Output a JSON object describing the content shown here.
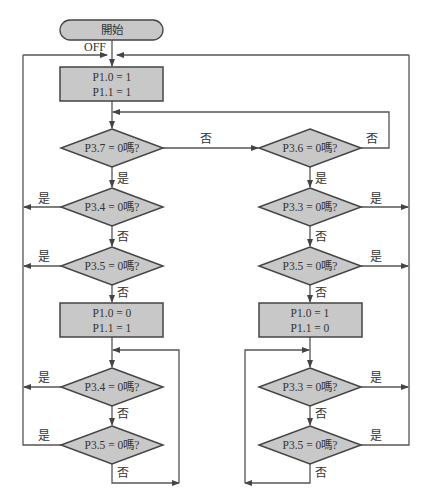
{
  "diagram": {
    "type": "flowchart",
    "colors": {
      "fill": "#c8c8c8",
      "stroke": "#444444",
      "line": "#555555",
      "text": "#333333"
    },
    "start": {
      "label": "開始"
    },
    "off_label": "OFF",
    "boxes": [
      {
        "id": "box1",
        "line1": "P1.0 = 1",
        "line2": "P1.1 = 1"
      },
      {
        "id": "box2",
        "line1": "P1.0 = 0",
        "line2": "P1.1 = 1"
      },
      {
        "id": "box3",
        "line1": "P1.0 = 1",
        "line2": "P1.1 = 0"
      }
    ],
    "decisions": [
      {
        "id": "d1",
        "label": "P3.7 = 0嗎?"
      },
      {
        "id": "d2",
        "label": "P3.6 = 0嗎?"
      },
      {
        "id": "d3",
        "label": "P3.4 = 0嗎?"
      },
      {
        "id": "d4",
        "label": "P3.5 = 0嗎?"
      },
      {
        "id": "d5",
        "label": "P3.3 = 0嗎?"
      },
      {
        "id": "d6",
        "label": "P3.5 = 0嗎?"
      },
      {
        "id": "d7",
        "label": "P3.4 = 0嗎?"
      },
      {
        "id": "d8",
        "label": "P3.5 = 0嗎?"
      },
      {
        "id": "d9",
        "label": "P3.3 = 0嗎?"
      },
      {
        "id": "d10",
        "label": "P3.5 = 0嗎?"
      }
    ],
    "edge_labels": {
      "yes": "是",
      "no": "否"
    }
  }
}
